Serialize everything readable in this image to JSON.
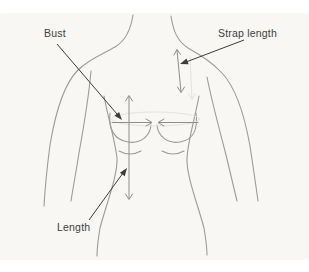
{
  "diagram": {
    "labels": {
      "bust": "Bust",
      "strap_length": "Strap length",
      "length": "Length"
    },
    "measures": [
      {
        "id": "bust-girth",
        "label": "Bust",
        "indicator": "horizontal converging arrows with ellipse at bust line"
      },
      {
        "id": "strap",
        "label": "Strap length",
        "indicator": "short vertical double arrow over shoulder"
      },
      {
        "id": "torso-length",
        "label": "Length",
        "indicator": "vertical double arrow from chest to hip"
      }
    ],
    "colors": {
      "page_background": "#ffffff",
      "panel_background": "#f8f7f4",
      "body_outline": "#9b9b9b",
      "measure_arrow": "#8d8d8d",
      "ghost_arrow": "#e4e3dd",
      "annotation": "#3c3c3c",
      "label_text": "#3f3f3f"
    }
  }
}
